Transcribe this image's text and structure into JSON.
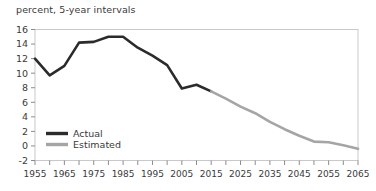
{
  "subtitle": "percent, 5-year intervals",
  "legend": {
    "actual_label": "Actual",
    "estimated_label": "Estimated"
  },
  "colors": {
    "actual": "#2b2b2b",
    "estimated": "#a5a5a5",
    "axis": "#8c8c8c",
    "text": "#3a3a3a",
    "frame": "#c9c9c9"
  },
  "chart_data": {
    "type": "line",
    "title": "",
    "subtitle": "percent, 5-year intervals",
    "xlabel": "",
    "ylabel": "percent",
    "xlim": [
      1955,
      2065
    ],
    "ylim": [
      -2,
      16
    ],
    "ytick_labels": [
      "16",
      "14",
      "12",
      "10",
      "8",
      "6",
      "4",
      "2",
      "0",
      "-2"
    ],
    "ytick_values": [
      16,
      14,
      12,
      10,
      8,
      6,
      4,
      2,
      0,
      -2
    ],
    "xtick_values": [
      1955,
      1960,
      1965,
      1970,
      1975,
      1980,
      1985,
      1990,
      1995,
      2000,
      2005,
      2010,
      2015,
      2020,
      2025,
      2030,
      2035,
      2040,
      2045,
      2050,
      2055,
      2060,
      2065
    ],
    "xtick_labels": [
      "1955",
      "",
      "1965",
      "",
      "1975",
      "",
      "1985",
      "",
      "1995",
      "",
      "2005",
      "",
      "2015",
      "",
      "2025",
      "",
      "2035",
      "",
      "2045",
      "",
      "2055",
      "",
      "2065"
    ],
    "xtick_labels_shown": [
      "1955",
      "1965",
      "1975",
      "1985",
      "1995",
      "2005",
      "2015",
      "2025",
      "2035",
      "2045",
      "2055",
      "2065"
    ],
    "grid": false,
    "legend_position": "inside-lower-left",
    "series": [
      {
        "name": "Actual",
        "color": "#2b2b2b",
        "x": [
          1955,
          1960,
          1965,
          1970,
          1975,
          1980,
          1985,
          1990,
          1995,
          2000,
          2005,
          2010,
          2015
        ],
        "values": [
          12.0,
          9.7,
          11.0,
          14.2,
          14.3,
          15.0,
          15.0,
          13.5,
          12.4,
          11.1,
          7.9,
          8.4,
          7.5
        ]
      },
      {
        "name": "Estimated",
        "color": "#a5a5a5",
        "x": [
          2015,
          2020,
          2025,
          2030,
          2035,
          2040,
          2045,
          2050,
          2055,
          2060,
          2065
        ],
        "values": [
          7.5,
          6.5,
          5.4,
          4.5,
          3.3,
          2.3,
          1.4,
          0.6,
          0.5,
          0.1,
          -0.4
        ]
      }
    ]
  }
}
